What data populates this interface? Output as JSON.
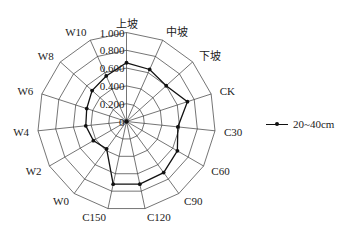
{
  "chart_data": {
    "type": "radar",
    "title": "",
    "categories": [
      "上坡",
      "中坡",
      "下坡",
      "CK",
      "C30",
      "C60",
      "C90",
      "C120",
      "C150",
      "W0",
      "W2",
      "W4",
      "W6",
      "W8",
      "W10"
    ],
    "series": [
      {
        "name": "20~40cm",
        "values": [
          0.66,
          0.64,
          0.6,
          0.72,
          0.58,
          0.66,
          0.71,
          0.72,
          0.72,
          0.38,
          0.43,
          0.46,
          0.47,
          0.52,
          0.56
        ],
        "color": "#111111",
        "marker": "circle"
      }
    ],
    "radial_ticks": [
      "0",
      "0.200",
      "0.400",
      "0.600",
      "0.800",
      "1.000"
    ],
    "radial_range": [
      0,
      1.0
    ],
    "grid_shape": "polygon",
    "legend_position": "right"
  },
  "legend": {
    "items": [
      {
        "label": "20~40cm"
      }
    ]
  }
}
